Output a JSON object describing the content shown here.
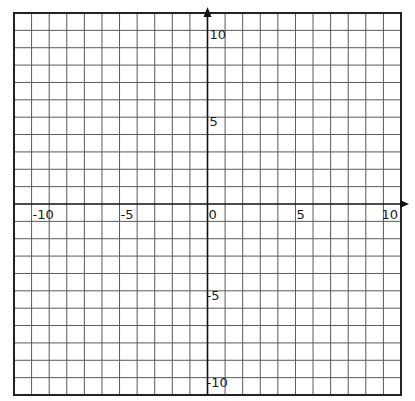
{
  "chart_data": {
    "type": "coordinate-grid",
    "title": "",
    "xlabel": "",
    "ylabel": "",
    "xlim": [
      -11,
      11
    ],
    "ylim": [
      -11,
      11
    ],
    "grid": true,
    "grid_step": 1,
    "x_ticks_labeled": [
      -10,
      -5,
      0,
      5,
      10
    ],
    "y_ticks_labeled": [
      10,
      5,
      -5,
      -10
    ],
    "x_tick_labels": [
      "-10",
      "-5",
      "0",
      "5",
      "10"
    ],
    "y_tick_labels": [
      "10",
      "5",
      "-5",
      "-10"
    ],
    "axis_arrows": [
      "x-positive",
      "y-positive"
    ],
    "series": []
  },
  "style": {
    "grid_color": "#5a5a5a",
    "axis_color": "#111111",
    "border_color": "#222222",
    "background": "#ffffff"
  },
  "geometry": {
    "left": 14,
    "top": 13,
    "right": 401,
    "bottom": 395
  }
}
